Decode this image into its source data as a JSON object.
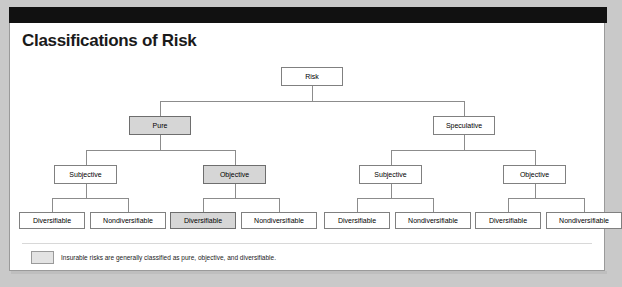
{
  "figure": {
    "title": "Classifications of Risk"
  },
  "legend": {
    "swatch_name": "shaded-box-swatch",
    "text": "Insurable risks are generally classified as pure, objective, and diversifiable."
  },
  "colors": {
    "shaded_fill": "#d6d6d6",
    "plain_fill": "#ffffff",
    "border": "#808080",
    "connector": "#8c8c8c",
    "band": "#111111",
    "page_background": "#c9c9c9",
    "title_color": "#1a1a1a"
  },
  "chart_data": {
    "type": "diagram",
    "diagram_type": "hierarchy-tree",
    "title": "Classifications of Risk",
    "levels": 4,
    "nodes": [
      {
        "id": "risk",
        "label": "Risk",
        "level": 0,
        "shaded": false,
        "parent": null
      },
      {
        "id": "pure",
        "label": "Pure",
        "level": 1,
        "shaded": true,
        "parent": "risk"
      },
      {
        "id": "speculative",
        "label": "Speculative",
        "level": 1,
        "shaded": false,
        "parent": "risk"
      },
      {
        "id": "pure-subj",
        "label": "Subjective",
        "level": 2,
        "shaded": false,
        "parent": "pure"
      },
      {
        "id": "pure-obj",
        "label": "Objective",
        "level": 2,
        "shaded": true,
        "parent": "pure"
      },
      {
        "id": "spec-subj",
        "label": "Subjective",
        "level": 2,
        "shaded": false,
        "parent": "speculative"
      },
      {
        "id": "spec-obj",
        "label": "Objective",
        "level": 2,
        "shaded": false,
        "parent": "speculative"
      },
      {
        "id": "pure-subj-div",
        "label": "Diversifiable",
        "level": 3,
        "shaded": false,
        "parent": "pure-subj"
      },
      {
        "id": "pure-subj-nondiv",
        "label": "Nondiversifiable",
        "level": 3,
        "shaded": false,
        "parent": "pure-subj"
      },
      {
        "id": "pure-obj-div",
        "label": "Diversifiable",
        "level": 3,
        "shaded": true,
        "parent": "pure-obj"
      },
      {
        "id": "pure-obj-nondiv",
        "label": "Nondiversifiable",
        "level": 3,
        "shaded": false,
        "parent": "pure-obj"
      },
      {
        "id": "spec-subj-div",
        "label": "Diversifiable",
        "level": 3,
        "shaded": false,
        "parent": "spec-subj"
      },
      {
        "id": "spec-subj-nondiv",
        "label": "Nondiversifiable",
        "level": 3,
        "shaded": false,
        "parent": "spec-subj"
      },
      {
        "id": "spec-obj-div",
        "label": "Diversifiable",
        "level": 3,
        "shaded": false,
        "parent": "spec-obj"
      },
      {
        "id": "spec-obj-nondiv",
        "label": "Nondiversifiable",
        "level": 3,
        "shaded": false,
        "parent": "spec-obj"
      }
    ],
    "shaded_path": [
      "Risk",
      "Pure",
      "Objective",
      "Diversifiable"
    ],
    "annotation": "Insurable risks are generally classified as pure, objective, and diversifiable."
  }
}
